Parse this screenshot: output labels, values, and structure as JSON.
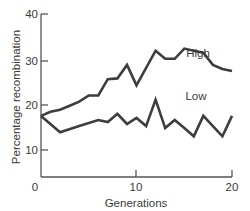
{
  "chart_data": {
    "type": "line",
    "title": "",
    "xlabel": "Generations",
    "ylabel": "Percentage recombination",
    "xlim": [
      0,
      20
    ],
    "ylim": [
      0,
      40
    ],
    "x_ticks": [
      0,
      10,
      20
    ],
    "y_ticks": [
      0,
      10,
      20,
      30,
      40
    ],
    "grid": false,
    "legend": "none (series labeled inline)",
    "series": [
      {
        "name": "High",
        "x": [
          0,
          1,
          2,
          3,
          4,
          5,
          6,
          7,
          8,
          9,
          10,
          12,
          13,
          14,
          15,
          16,
          17,
          18,
          19,
          20
        ],
        "values": [
          15,
          16,
          16.5,
          17.5,
          18.5,
          20,
          20,
          24,
          24.2,
          27.5,
          22.5,
          31,
          29,
          29,
          31.5,
          31,
          30.5,
          27.5,
          26.5,
          26
        ]
      },
      {
        "name": "Low",
        "x": [
          0,
          2,
          4,
          6,
          7,
          8,
          9,
          10,
          11,
          12,
          13,
          14,
          15,
          16,
          17,
          18,
          19,
          20
        ],
        "values": [
          15,
          11,
          12.5,
          14,
          13.5,
          15.5,
          13,
          14.5,
          12.5,
          19,
          12,
          14,
          12,
          10,
          15,
          12.5,
          10,
          15
        ]
      }
    ],
    "annotations": [
      {
        "text": "High",
        "x": 16,
        "y": 34
      },
      {
        "text": "Low",
        "x": 15.5,
        "y": 17
      }
    ]
  },
  "labels": {
    "y_axis_title": "Percentage recombination",
    "x_axis_title": "Generations",
    "high_label": "High",
    "low_label": "Low",
    "tick_0": "0",
    "tick_10": "10",
    "tick_20": "20",
    "tick_30": "30",
    "tick_40": "40",
    "xtick_0": "0",
    "xtick_10": "10",
    "xtick_20": "20"
  }
}
